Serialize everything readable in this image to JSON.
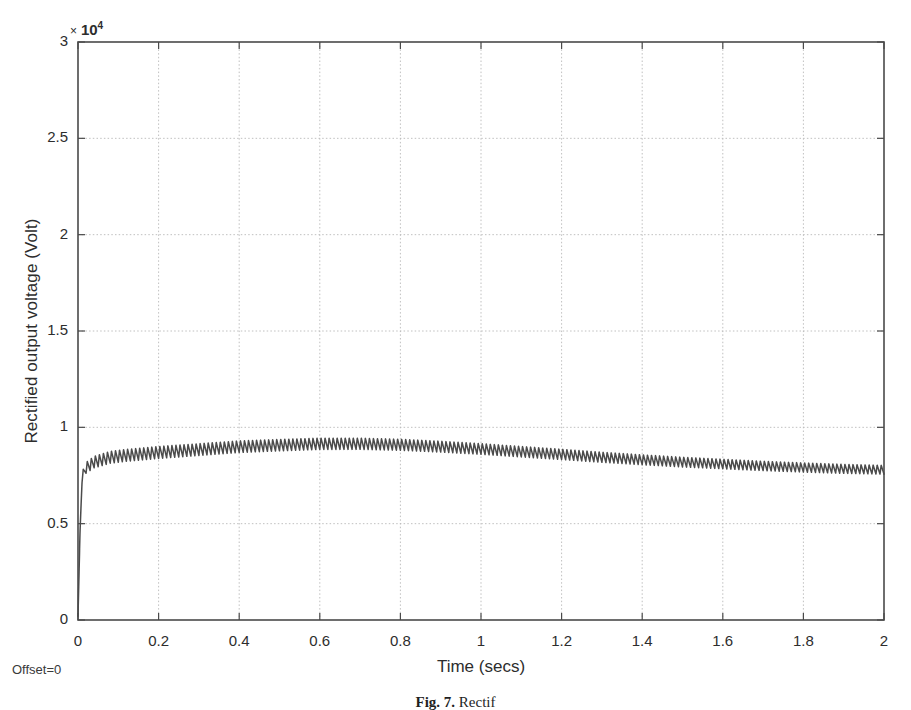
{
  "figure": {
    "caption_number": "Fig. 7.",
    "caption_text": "Rectif",
    "offset_note": "Offset=0",
    "scale_multiplier_symbol": "×",
    "scale_base": "10",
    "scale_exponent": "4",
    "axis_color": "#4a4a4a",
    "grid_color": "#b9b9b9",
    "trace_color": "#4b4b4b",
    "background_color": "#ffffff"
  },
  "chart_data": {
    "type": "line",
    "title": "",
    "subtitle": "",
    "xlabel": "Time (secs)",
    "ylabel": "Rectified output voltage (Volt)",
    "y_scale_factor": 10000,
    "y_scale_label": "× 10⁴",
    "xlim": [
      0,
      2
    ],
    "ylim": [
      0,
      3
    ],
    "xticks": [
      0,
      0.2,
      0.4,
      0.6,
      0.8,
      1,
      1.2,
      1.4,
      1.6,
      1.8,
      2
    ],
    "xtick_labels": [
      "0",
      "0.2",
      "0.4",
      "0.6",
      "0.8",
      "1",
      "1.2",
      "1.4",
      "1.6",
      "1.8",
      "2"
    ],
    "yticks": [
      0,
      0.5,
      1,
      1.5,
      2,
      2.5,
      3
    ],
    "ytick_labels": [
      "0",
      "0.5",
      "1",
      "1.5",
      "2",
      "2.5",
      "3"
    ],
    "grid": true,
    "legend": null,
    "legend_position": "none",
    "annotations": [
      "Offset=0"
    ],
    "series": [
      {
        "name": "Rectified output voltage",
        "description": "Full-wave rectified DC output with ~100 Hz ripple; rises steeply from 0 at t=0, ripple envelope peaks near 0.95e4 V around t=0.6-0.7 s then decays to about 0.78e4 V at t=2 s.",
        "ripple_frequency_hz": 100,
        "envelope_mean": {
          "x": [
            0,
            0.005,
            0.01,
            0.02,
            0.04,
            0.08,
            0.12,
            0.2,
            0.3,
            0.4,
            0.5,
            0.6,
            0.7,
            0.8,
            0.9,
            1.0,
            1.1,
            1.2,
            1.3,
            1.4,
            1.5,
            1.6,
            1.7,
            1.8,
            1.9,
            2.0
          ],
          "y": [
            0.02,
            0.45,
            0.74,
            0.79,
            0.82,
            0.845,
            0.855,
            0.87,
            0.885,
            0.9,
            0.908,
            0.915,
            0.915,
            0.91,
            0.9,
            0.888,
            0.874,
            0.86,
            0.845,
            0.832,
            0.82,
            0.81,
            0.8,
            0.792,
            0.785,
            0.78
          ]
        },
        "ripple_amplitude": {
          "x": [
            0,
            0.01,
            0.05,
            0.2,
            0.5,
            0.8,
            1.2,
            1.6,
            2.0
          ],
          "y": [
            0.0,
            0.055,
            0.062,
            0.063,
            0.06,
            0.058,
            0.054,
            0.05,
            0.046
          ]
        },
        "units": "10^4 Volt"
      }
    ]
  }
}
